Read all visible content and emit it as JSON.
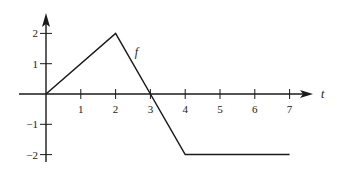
{
  "chart_data": {
    "type": "line",
    "title": "",
    "xlabel": "t",
    "ylabel": "",
    "series": [
      {
        "name": "f",
        "x": [
          0,
          2,
          3,
          4,
          7
        ],
        "y": [
          0,
          2,
          0,
          -2,
          -2
        ]
      }
    ],
    "series_label": "f",
    "series_label_position": {
      "x": 2.55,
      "y": 1.25
    },
    "xlim": [
      -0.8,
      7.9
    ],
    "ylim": [
      -2.3,
      2.9
    ],
    "xticks": [
      1,
      2,
      3,
      4,
      5,
      6,
      7
    ],
    "xtick_labels": [
      "1",
      "2",
      "3",
      "4",
      "5",
      "6",
      "7"
    ],
    "yticks": [
      2,
      1,
      -1,
      -2
    ],
    "ytick_labels": [
      "2",
      "1",
      "−1",
      "−2"
    ],
    "grid": false,
    "legend": "none",
    "colors": {
      "line": "#1a1a1a",
      "axis": "#1a1a1a",
      "background": "#ffffff"
    }
  }
}
